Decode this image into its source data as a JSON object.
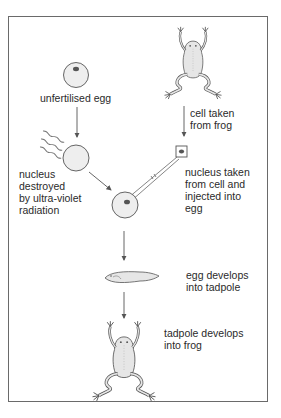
{
  "diagram": {
    "type": "process-flow",
    "colors": {
      "line": "#555555",
      "frame": "#6a6a6a",
      "fill": "#eeeeee",
      "nucleus": "#555555",
      "text": "#2a2a2a"
    },
    "labels": {
      "unfertilised_egg": "unfertilised egg",
      "cell_taken": "cell taken\nfrom frog",
      "nucleus_destroyed": "nucleus\ndestroyed\nby ultra-violet\nradiation",
      "nucleus_injected": "nucleus taken\nfrom cell and\ninjected into\negg",
      "egg_develops": "egg develops\ninto tadpole",
      "tadpole_develops": "tadpole develops\ninto frog"
    },
    "nodes": [
      {
        "id": "unfertilised-egg",
        "icon": "egg-with-nucleus-icon"
      },
      {
        "id": "donor-frog",
        "icon": "frog-icon"
      },
      {
        "id": "enucleated-egg",
        "icon": "empty-egg-icon"
      },
      {
        "id": "donor-cell",
        "icon": "cell-icon"
      },
      {
        "id": "injected-egg",
        "icon": "egg-with-nucleus-icon"
      },
      {
        "id": "tadpole",
        "icon": "tadpole-icon"
      },
      {
        "id": "cloned-frog",
        "icon": "frog-icon"
      }
    ],
    "edges": [
      {
        "from": "unfertilised-egg",
        "to": "enucleated-egg"
      },
      {
        "from": "donor-frog",
        "to": "donor-cell"
      },
      {
        "from": "enucleated-egg",
        "to": "injected-egg"
      },
      {
        "from": "donor-cell",
        "to": "injected-egg",
        "style": "micropipette"
      },
      {
        "from": "injected-egg",
        "to": "tadpole"
      },
      {
        "from": "tadpole",
        "to": "cloned-frog"
      }
    ]
  }
}
